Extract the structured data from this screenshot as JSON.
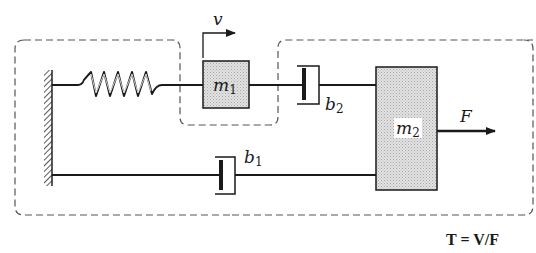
{
  "diagram": {
    "labels": {
      "velocity": "v",
      "spring": "k",
      "mass1": "m",
      "mass1_sub": "1",
      "mass2": "m",
      "mass2_sub": "2",
      "damper1": "b",
      "damper1_sub": "1",
      "damper2": "b",
      "damper2_sub": "2",
      "force": "F"
    },
    "equation": "T = V/F",
    "colors": {
      "line": "#1a1a1a",
      "dashed_boundary": "#555555",
      "mass_fill": "#d9d9d9"
    },
    "components": [
      {
        "type": "wall",
        "name": "ground"
      },
      {
        "type": "spring",
        "name": "k",
        "connects": [
          "ground",
          "m1"
        ]
      },
      {
        "type": "mass",
        "name": "m1"
      },
      {
        "type": "damper",
        "name": "b2",
        "connects": [
          "m1",
          "m2"
        ]
      },
      {
        "type": "mass",
        "name": "m2"
      },
      {
        "type": "damper",
        "name": "b1",
        "connects": [
          "ground",
          "m2"
        ]
      },
      {
        "type": "force",
        "name": "F",
        "acts_on": "m2"
      },
      {
        "type": "velocity",
        "name": "v",
        "of": "m1"
      }
    ]
  }
}
